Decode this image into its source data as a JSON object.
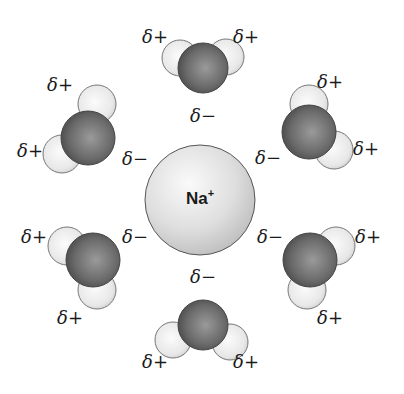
{
  "diagram": {
    "type": "ion hydration shell",
    "ion": {
      "label": "Na",
      "charge": "+",
      "cx": 200,
      "cy": 200,
      "r": 55,
      "color": "#dcdcdc"
    },
    "colors": {
      "oxygen": "#6e6e6e",
      "hydrogen": "#ececec",
      "ion": "#dcdcdc",
      "outline": "#444444",
      "text": "#1a1a1a"
    },
    "waters": [
      {
        "name": "top",
        "o": [
          203,
          68,
          25
        ],
        "h": [
          [
            180,
            58,
            18
          ],
          [
            226,
            57,
            18
          ]
        ],
        "labels": [
          {
            "text": "δ+",
            "x": 155,
            "y": 37
          },
          {
            "text": "δ+",
            "x": 246,
            "y": 37
          },
          {
            "text": "δ−",
            "x": 203,
            "y": 116
          }
        ]
      },
      {
        "name": "upper-left",
        "o": [
          88,
          138,
          27
        ],
        "h": [
          [
            97,
            104,
            19
          ],
          [
            62,
            154,
            19
          ]
        ],
        "labels": [
          {
            "text": "δ+",
            "x": 60,
            "y": 85
          },
          {
            "text": "δ+",
            "x": 30,
            "y": 151
          },
          {
            "text": "δ−",
            "x": 135,
            "y": 159
          }
        ]
      },
      {
        "name": "upper-right",
        "o": [
          309,
          132,
          27
        ],
        "h": [
          [
            309,
            104,
            19
          ],
          [
            334,
            150,
            19
          ]
        ],
        "labels": [
          {
            "text": "δ+",
            "x": 330,
            "y": 82
          },
          {
            "text": "δ−",
            "x": 268,
            "y": 158
          },
          {
            "text": "δ+",
            "x": 366,
            "y": 149
          }
        ]
      },
      {
        "name": "lower-left",
        "o": [
          93,
          260,
          27
        ],
        "h": [
          [
            67,
            246,
            19
          ],
          [
            97,
            290,
            19
          ]
        ],
        "labels": [
          {
            "text": "δ+",
            "x": 34,
            "y": 237
          },
          {
            "text": "δ−",
            "x": 135,
            "y": 237
          },
          {
            "text": "δ+",
            "x": 70,
            "y": 318
          }
        ]
      },
      {
        "name": "lower-right",
        "o": [
          310,
          260,
          27
        ],
        "h": [
          [
            336,
            246,
            19
          ],
          [
            307,
            290,
            19
          ]
        ],
        "labels": [
          {
            "text": "δ−",
            "x": 270,
            "y": 237
          },
          {
            "text": "δ+",
            "x": 368,
            "y": 237
          },
          {
            "text": "δ+",
            "x": 330,
            "y": 318
          }
        ]
      },
      {
        "name": "bottom",
        "o": [
          203,
          325,
          25
        ],
        "h": [
          [
            173,
            340,
            18
          ],
          [
            230,
            342,
            18
          ]
        ],
        "labels": [
          {
            "text": "δ−",
            "x": 203,
            "y": 277
          },
          {
            "text": "δ+",
            "x": 155,
            "y": 362
          },
          {
            "text": "δ+",
            "x": 246,
            "y": 362
          }
        ]
      }
    ]
  }
}
